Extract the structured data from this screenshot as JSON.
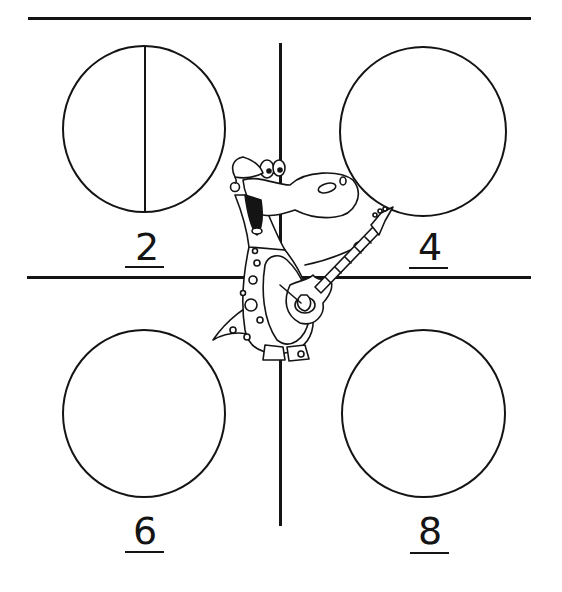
{
  "worksheet": {
    "title": "Fraction circles worksheet",
    "colors": {
      "ink": "#141414",
      "paper": "#ffffff"
    },
    "cells": [
      {
        "id": "top-left",
        "number": "2",
        "circle_divisions": 2,
        "divided": true
      },
      {
        "id": "top-right",
        "number": "4",
        "circle_divisions": 4,
        "divided": false
      },
      {
        "id": "bottom-left",
        "number": "6",
        "circle_divisions": 6,
        "divided": false
      },
      {
        "id": "bottom-right",
        "number": "8",
        "circle_divisions": 8,
        "divided": false
      }
    ],
    "mascot": {
      "description": "Cartoon dinosaur wearing a Santa hat playing an electric guitar",
      "icon": "dinosaur-guitar-icon"
    }
  }
}
